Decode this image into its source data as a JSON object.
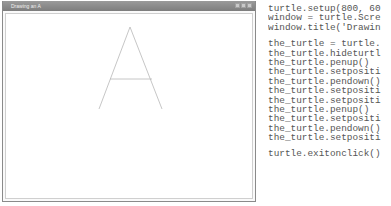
{
  "window": {
    "title": "Drawing an A",
    "controls": [
      "minimize",
      "maximize",
      "close"
    ]
  },
  "drawing": {
    "stroke_color": "#b8b8b8",
    "letter": "A",
    "apex": [
      130,
      27
    ],
    "left_foot": [
      99,
      109
    ],
    "right_foot": [
      162,
      109
    ],
    "crossbar": {
      "x1": 110,
      "x2": 152,
      "y": 79
    }
  },
  "code": {
    "lines": [
      "turtle.setup(800, 60",
      "window = turtle.Scre",
      "window.title('Drawin",
      "",
      "the_turtle = turtle.",
      "the_turtle.hideturtl",
      "the_turtle.penup()",
      "the_turtle.setpositi",
      "the_turtle.pendown()",
      "the_turtle.setpositi",
      "the_turtle.setpositi",
      "the_turtle.penup()",
      "the_turtle.setpositi",
      "the_turtle.pendown()",
      "the_turtle.setpositi",
      "",
      "turtle.exitonclick()"
    ]
  }
}
